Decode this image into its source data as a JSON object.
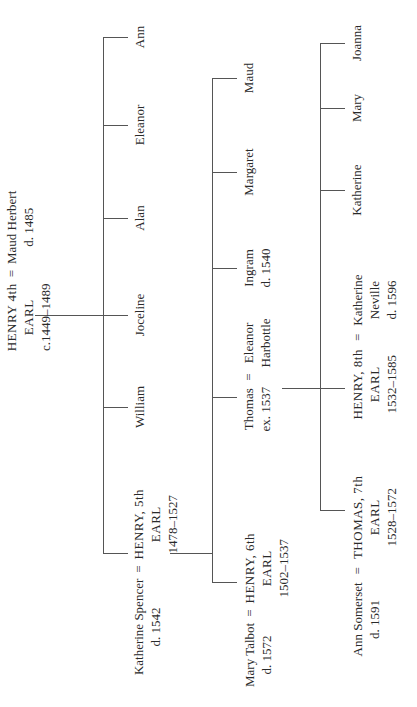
{
  "diagram_type": "family-tree",
  "generation1": {
    "husband": {
      "name": "HENRY 4th",
      "title": "EARL",
      "dates": "c.1449–1489"
    },
    "marriage_sign": "=",
    "wife": {
      "name": "Maud Herbert",
      "dates": "d. 1485"
    }
  },
  "generation2": {
    "children": [
      {
        "name": "Ann"
      },
      {
        "name": "Eleanor"
      },
      {
        "name": "Alan"
      },
      {
        "name": "Joceline"
      },
      {
        "name": "William"
      }
    ],
    "heir": {
      "name": "HENRY, 5th",
      "title": "EARL",
      "dates": "1478–1527"
    },
    "heir_spouse": {
      "name": "Katherine Spencer",
      "dates": "d. 1542"
    },
    "marriage_sign": "="
  },
  "generation3": {
    "children": [
      {
        "name": "Maud"
      },
      {
        "name": "Margaret"
      },
      {
        "name": "Ingram",
        "dates": "d. 1540"
      }
    ],
    "thomas": {
      "name": "Thomas",
      "dates": "ex. 1537"
    },
    "thomas_spouse": {
      "name": "Eleanor",
      "name2": "Harbottle"
    },
    "heir": {
      "name": "HENRY, 6th",
      "title": "EARL",
      "dates": "1502–1537"
    },
    "heir_spouse": {
      "name": "Mary Talbot",
      "dates": "d. 1572"
    },
    "marriage_sign": "="
  },
  "generation4": {
    "children": [
      {
        "name": "Joanna"
      },
      {
        "name": "Mary"
      },
      {
        "name": "Katherine"
      }
    ],
    "henry8": {
      "name": "HENRY, 8th",
      "title": "EARL",
      "dates": "1532–1585"
    },
    "henry8_spouse": {
      "name": "Katherine",
      "name2": "Neville",
      "dates": "d. 1596"
    },
    "thomas7": {
      "name": "THOMAS, 7th",
      "title": "EARL",
      "dates": "1528–1572"
    },
    "thomas7_spouse": {
      "name": "Ann Somerset",
      "dates": "d. 1591"
    },
    "marriage_sign": "="
  }
}
